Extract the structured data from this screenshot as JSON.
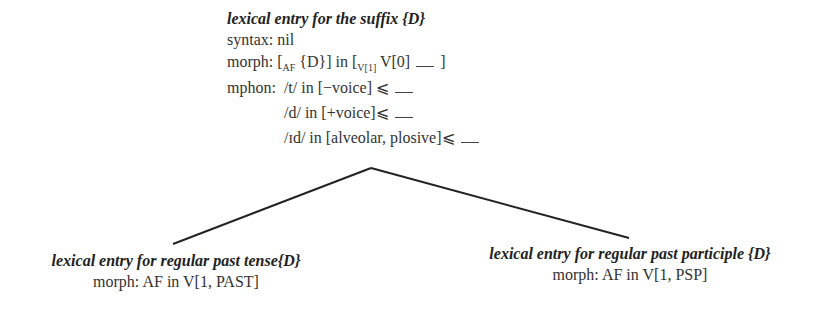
{
  "root": {
    "title": "lexical entry for the suffix {D}",
    "syntax": "syntax: nil",
    "morph": {
      "label": "morph: [",
      "sub1": "AF",
      "mid": " {D}] in [",
      "sub2": "V[1]",
      "end": " V[0] ",
      "close": " ]"
    },
    "mphon": {
      "label": "mphon:",
      "rules": [
        {
          "text": "/t/ in [−voice] ⩽",
          "gap": true
        },
        {
          "text": "/d/ in [+voice]⩽",
          "gap": true
        },
        {
          "text": "/ɪd/ in [alveolar, plosive]⩽",
          "gap": true
        }
      ]
    }
  },
  "children": [
    {
      "title": "lexical entry for regular past tense{D}",
      "morph": "morph: AF in V[1, PAST]"
    },
    {
      "title": "lexical entry for regular past participle {D}",
      "morph": "morph: AF in V[1, PSP]"
    }
  ],
  "edges": {
    "apex": [
      371,
      168
    ],
    "left": [
      173,
      244
    ],
    "right": [
      629,
      238
    ],
    "color": "#222222"
  }
}
